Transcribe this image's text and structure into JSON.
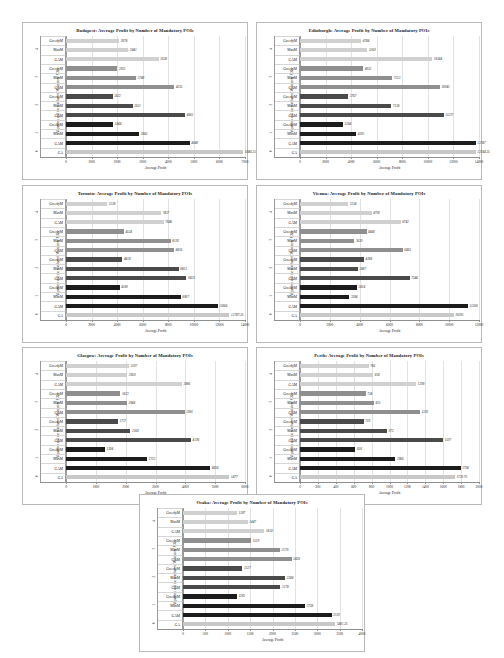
{
  "page": {
    "background": "#ffffff",
    "series_colors": {
      "g4": "#d0d0d0",
      "g3": "#8f8f8f",
      "g2": "#4a4a4a",
      "g1": "#1c1c1c",
      "ga": "#c8c8c8"
    },
    "axis_label_x": "Average Profit",
    "axis_label_y": "Algorithm and the number of Mandatory POIs",
    "title_suffix": "Average Profit by Number of Mandatory POIs",
    "group_labels": [
      "4",
      "3",
      "2",
      "1",
      "0"
    ],
    "algorithms": [
      "GreedyM",
      "MaxM",
      "GAM"
    ],
    "ga_label": "GA"
  },
  "chart_data": [
    {
      "type": "bar",
      "id": "budapest",
      "city": "Budapest",
      "title": "Budapest: Average Profit by Number of Mandatory POIs",
      "xlabel": "Average Profit",
      "ylabel": "Algorithm and the number of Mandatory POIs",
      "xlim": [
        0,
        7000
      ],
      "xticks": [
        "0",
        "1000",
        "2000",
        "3000",
        "4000",
        "5000",
        "6000",
        "7000"
      ],
      "grid": true,
      "groups": [
        {
          "label": "4",
          "shade": "g4",
          "bars": [
            {
              "name": "GreedyM",
              "value": 2078
            },
            {
              "name": "MaxM",
              "value": 2441
            },
            {
              "name": "GAM",
              "value": 3628
            }
          ]
        },
        {
          "label": "3",
          "shade": "g3",
          "bars": [
            {
              "name": "GreedyM",
              "value": 2011
            },
            {
              "name": "MaxM",
              "value": 2740
            },
            {
              "name": "GAM",
              "value": 4235
            }
          ]
        },
        {
          "label": "2",
          "shade": "g2",
          "bars": [
            {
              "name": "GreedyM",
              "value": 1822
            },
            {
              "name": "MaxM",
              "value": 2611
            },
            {
              "name": "GAM",
              "value": 4661
            }
          ]
        },
        {
          "label": "1",
          "shade": "g1",
          "bars": [
            {
              "name": "GreedyM",
              "value": 1844
            },
            {
              "name": "MaxM",
              "value": 2865
            },
            {
              "name": "GAM",
              "value": 4840
            }
          ]
        },
        {
          "label": "0",
          "shade": "ga",
          "bars": [
            {
              "name": "GA",
              "value": 6940.25,
              "display": "6940.25"
            }
          ]
        }
      ]
    },
    {
      "type": "bar",
      "id": "edinburgh",
      "city": "Edinburgh",
      "title": "Edinburgh: Average Profit by Number of Mandatory POIs",
      "xlabel": "Average Profit",
      "ylabel": "Algorithm and the number of Mandatory POIs",
      "xlim": [
        0,
        14000
      ],
      "xticks": [
        "0",
        "2000",
        "4000",
        "6000",
        "8000",
        "10000",
        "12000",
        "14000"
      ],
      "grid": true,
      "groups": [
        {
          "label": "4",
          "shade": "g4",
          "bars": [
            {
              "name": "GreedyM",
              "value": 4784
            },
            {
              "name": "MaxM",
              "value": 5269
            },
            {
              "name": "GAM",
              "value": 10344
            }
          ]
        },
        {
          "label": "3",
          "shade": "g3",
          "bars": [
            {
              "name": "GreedyM",
              "value": 4932
            },
            {
              "name": "MaxM",
              "value": 7213
            },
            {
              "name": "GAM",
              "value": 10941
            }
          ]
        },
        {
          "label": "2",
          "shade": "g2",
          "bars": [
            {
              "name": "GreedyM",
              "value": 3767
            },
            {
              "name": "MaxM",
              "value": 7138
            },
            {
              "name": "GAM",
              "value": 11237
            }
          ]
        },
        {
          "label": "1",
          "shade": "g1",
          "bars": [
            {
              "name": "GreedyM",
              "value": 3364
            },
            {
              "name": "MaxM",
              "value": 4391
            },
            {
              "name": "GAM",
              "value": 13747
            }
          ]
        },
        {
          "label": "0",
          "shade": "ga",
          "bars": [
            {
              "name": "GA",
              "value": 13744.25,
              "display": "13744.25"
            }
          ]
        }
      ]
    },
    {
      "type": "bar",
      "id": "toronto",
      "city": "Toronto",
      "title": "Toronto: Average Profit by Number of Mandatory POIs",
      "xlabel": "Average Profit",
      "ylabel": "Algorithm and the number of Mandatory POIs",
      "xlim": [
        0,
        14000
      ],
      "xticks": [
        "0",
        "2000",
        "4000",
        "6000",
        "8000",
        "10000",
        "12000",
        "14000"
      ],
      "grid": true,
      "groups": [
        {
          "label": "4",
          "shade": "g4",
          "bars": [
            {
              "name": "GreedyM",
              "value": 3228
            },
            {
              "name": "MaxM",
              "value": 7437
            },
            {
              "name": "GAM",
              "value": 7646
            }
          ]
        },
        {
          "label": "3",
          "shade": "g3",
          "bars": [
            {
              "name": "GreedyM",
              "value": 4524
            },
            {
              "name": "MaxM",
              "value": 8192
            },
            {
              "name": "GAM",
              "value": 8436
            }
          ]
        },
        {
          "label": "2",
          "shade": "g2",
          "bars": [
            {
              "name": "GreedyM",
              "value": 4410
            },
            {
              "name": "MaxM",
              "value": 8813
            },
            {
              "name": "GAM",
              "value": 9419
            }
          ]
        },
        {
          "label": "1",
          "shade": "g1",
          "bars": [
            {
              "name": "GreedyM",
              "value": 4189
            },
            {
              "name": "MaxM",
              "value": 8967
            },
            {
              "name": "GAM",
              "value": 11866
            }
          ]
        },
        {
          "label": "0",
          "shade": "ga",
          "bars": [
            {
              "name": "GA",
              "value": 12787.25,
              "display": "12787.25"
            }
          ]
        }
      ]
    },
    {
      "type": "bar",
      "id": "vienna",
      "city": "Vienna",
      "title": "Vienna: Average Profit by Number of Mandatory POIs",
      "xlabel": "Average Profit",
      "ylabel": "Algorithm and the number of Mandatory POIs",
      "xlim": [
        0,
        12000
      ],
      "xticks": [
        "0",
        "2000",
        "4000",
        "6000",
        "8000",
        "10000",
        "12000"
      ],
      "grid": true,
      "groups": [
        {
          "label": "4",
          "shade": "g4",
          "bars": [
            {
              "name": "GreedyM",
              "value": 3234
            },
            {
              "name": "MaxM",
              "value": 4799
            },
            {
              "name": "GAM",
              "value": 6742
            }
          ]
        },
        {
          "label": "3",
          "shade": "g3",
          "bars": [
            {
              "name": "GreedyM",
              "value": 4460
            },
            {
              "name": "MaxM",
              "value": 3639
            },
            {
              "name": "GAM",
              "value": 6882
            }
          ]
        },
        {
          "label": "2",
          "shade": "g2",
          "bars": [
            {
              "name": "GreedyM",
              "value": 4288
            },
            {
              "name": "MaxM",
              "value": 3887
            },
            {
              "name": "GAM",
              "value": 7344
            }
          ]
        },
        {
          "label": "1",
          "shade": "g1",
          "bars": [
            {
              "name": "GreedyM",
              "value": 3814
            },
            {
              "name": "MaxM",
              "value": 3304
            },
            {
              "name": "GAM",
              "value": 11260
            }
          ]
        },
        {
          "label": "0",
          "shade": "ga",
          "bars": [
            {
              "name": "GA",
              "value": 10295,
              "display": "10295"
            }
          ]
        }
      ]
    },
    {
      "type": "bar",
      "id": "glasgow",
      "city": "Glasgow",
      "title": "Glasgow: Average Profit by Number of Mandatory POIs",
      "xlabel": "Average Profit",
      "ylabel": "Algorithm and the number of Mandatory POIs",
      "xlim": [
        0,
        6000
      ],
      "xticks": [
        "0",
        "1000",
        "2000",
        "3000",
        "4000",
        "5000",
        "6000"
      ],
      "grid": true,
      "groups": [
        {
          "label": "4",
          "shade": "g4",
          "bars": [
            {
              "name": "GreedyM",
              "value": 2107
            },
            {
              "name": "MaxM",
              "value": 2059
            },
            {
              "name": "GAM",
              "value": 3886
            }
          ]
        },
        {
          "label": "3",
          "shade": "g3",
          "bars": [
            {
              "name": "GreedyM",
              "value": 1822
            },
            {
              "name": "MaxM",
              "value": 2044
            },
            {
              "name": "GAM",
              "value": 3981
            }
          ]
        },
        {
          "label": "2",
          "shade": "g2",
          "bars": [
            {
              "name": "GreedyM",
              "value": 1737
            },
            {
              "name": "MaxM",
              "value": 2160
            },
            {
              "name": "GAM",
              "value": 4190
            }
          ]
        },
        {
          "label": "1",
          "shade": "g1",
          "bars": [
            {
              "name": "GreedyM",
              "value": 1304
            },
            {
              "name": "MaxM",
              "value": 2722
            },
            {
              "name": "GAM",
              "value": 4834
            }
          ]
        },
        {
          "label": "0",
          "shade": "ga",
          "bars": [
            {
              "name": "GA",
              "value": 5477,
              "display": "5477"
            }
          ]
        }
      ]
    },
    {
      "type": "bar",
      "id": "perth",
      "city": "Perth",
      "title": "Perth: Average Profit by Number of Mandatory POIs",
      "xlabel": "Average Profit",
      "ylabel": "Algorithm and the number of Mandatory POIs",
      "xlim": [
        0,
        2000
      ],
      "xticks": [
        "0",
        "200",
        "400",
        "600",
        "800",
        "1000",
        "1200",
        "1400",
        "1600",
        "1800",
        "2000"
      ],
      "grid": true,
      "groups": [
        {
          "label": "4",
          "shade": "g4",
          "bars": [
            {
              "name": "GreedyM",
              "value": 766
            },
            {
              "name": "MaxM",
              "value": 818
            },
            {
              "name": "GAM",
              "value": 1298
            }
          ]
        },
        {
          "label": "3",
          "shade": "g3",
          "bars": [
            {
              "name": "GreedyM",
              "value": 734
            },
            {
              "name": "MaxM",
              "value": 825
            },
            {
              "name": "GAM",
              "value": 1339
            }
          ]
        },
        {
          "label": "2",
          "shade": "g2",
          "bars": [
            {
              "name": "GreedyM",
              "value": 710
            },
            {
              "name": "MaxM",
              "value": 972
            },
            {
              "name": "GAM",
              "value": 1597
            }
          ]
        },
        {
          "label": "1",
          "shade": "g1",
          "bars": [
            {
              "name": "GreedyM",
              "value": 618
            },
            {
              "name": "MaxM",
              "value": 1066
            },
            {
              "name": "GAM",
              "value": 1794
            }
          ]
        },
        {
          "label": "0",
          "shade": "ga",
          "bars": [
            {
              "name": "GA",
              "value": 1729.75,
              "display": "1729.75"
            }
          ]
        }
      ]
    },
    {
      "type": "bar",
      "id": "osaka",
      "city": "Osaka",
      "title": "Osaka: Average Profit by Number of Mandatory POIs",
      "xlabel": "Average Profit",
      "ylabel": "Algorithm and the number of Mandatory POIs",
      "xlim": [
        0,
        4000
      ],
      "xticks": [
        "0",
        "500",
        "1000",
        "1500",
        "2000",
        "2500",
        "3000",
        "3500",
        "4000"
      ],
      "grid": true,
      "groups": [
        {
          "label": "4",
          "shade": "g4",
          "bars": [
            {
              "name": "GreedyM",
              "value": 1207
            },
            {
              "name": "MaxM",
              "value": 1447
            },
            {
              "name": "GAM",
              "value": 1818
            }
          ]
        },
        {
          "label": "3",
          "shade": "g3",
          "bars": [
            {
              "name": "GreedyM",
              "value": 1519
            },
            {
              "name": "MaxM",
              "value": 2170
            },
            {
              "name": "GAM",
              "value": 2428
            }
          ]
        },
        {
          "label": "2",
          "shade": "g2",
          "bars": [
            {
              "name": "GreedyM",
              "value": 1327
            },
            {
              "name": "MaxM",
              "value": 2284
            },
            {
              "name": "GAM",
              "value": 2178
            }
          ]
        },
        {
          "label": "1",
          "shade": "g1",
          "bars": [
            {
              "name": "GreedyM",
              "value": 1203
            },
            {
              "name": "MaxM",
              "value": 2728
            },
            {
              "name": "GAM",
              "value": 3319
            }
          ]
        },
        {
          "label": "0",
          "shade": "ga",
          "bars": [
            {
              "name": "GA",
              "value": 3401.25,
              "display": "3401.25"
            }
          ]
        }
      ]
    }
  ]
}
